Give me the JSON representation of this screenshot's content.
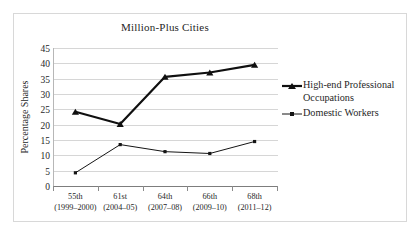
{
  "chart_data": {
    "type": "line",
    "title": "Million-Plus Cities",
    "xlabel": "",
    "ylabel": "Percentage Shares",
    "ylim": [
      0,
      45
    ],
    "ytick_step": 5,
    "grid": true,
    "legend_position": "right",
    "categories": [
      "55th\n(1999–2000)",
      "61st\n(2004–05)",
      "64th\n(2007–08)",
      "66th\n(2009–10)",
      "68th\n(2011–12)"
    ],
    "category_lines": [
      {
        "line1": "55th",
        "line2": "(1999–2000)"
      },
      {
        "line1": "61st",
        "line2": "(2004–05)"
      },
      {
        "line1": "64th",
        "line2": "(2007–08)"
      },
      {
        "line1": "66th",
        "line2": "(2009–10)"
      },
      {
        "line1": "68th",
        "line2": "(2011–12)"
      }
    ],
    "ytick_labels": [
      "45",
      "40",
      "35",
      "30",
      "25",
      "20",
      "15",
      "10",
      "5",
      "0"
    ],
    "ytick_values": [
      45,
      40,
      35,
      30,
      25,
      20,
      15,
      10,
      5,
      0
    ],
    "series": [
      {
        "name": "High-end Professional Occupations",
        "values": [
          24.2,
          20.2,
          35.6,
          37.0,
          39.5
        ],
        "color": "#101010",
        "line_width": 2.2,
        "marker": "triangle"
      },
      {
        "name": "Domestic Workers",
        "values": [
          4.3,
          13.5,
          11.2,
          10.6,
          14.5
        ],
        "color": "#151515",
        "line_width": 1.0,
        "marker": "square"
      }
    ]
  },
  "legend": {
    "items": [
      {
        "label": "High-end Professional Occupations",
        "marker": "triangle-marker"
      },
      {
        "label": "Domestic Workers",
        "marker": "square-marker"
      }
    ]
  },
  "colors": {
    "grid": "#d6d6d6",
    "axis": "#7d7d7d",
    "frame": "#d8d8d8",
    "text": "#1f1f1f",
    "background": "#ffffff"
  }
}
